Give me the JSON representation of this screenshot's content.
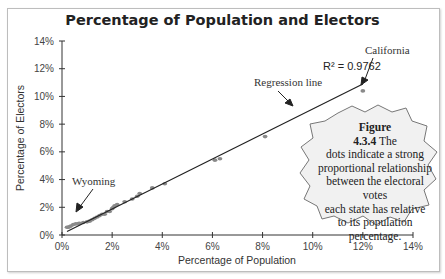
{
  "chart_data": {
    "type": "scatter",
    "title": "Percentage of  Population and Electors",
    "xlabel": "Percentage of Population",
    "ylabel": "Percentage of Electors",
    "xlim": [
      0,
      14
    ],
    "ylim": [
      0,
      14
    ],
    "x_ticks": [
      "0%",
      "2%",
      "4%",
      "6%",
      "8%",
      "10%",
      "12%",
      "14%"
    ],
    "y_ticks": [
      "0%",
      "2%",
      "4%",
      "6%",
      "8%",
      "10%",
      "12%",
      "14%"
    ],
    "grid": false,
    "legend": null,
    "points": [
      {
        "x": 0.2,
        "y": 0.56
      },
      {
        "x": 0.25,
        "y": 0.56
      },
      {
        "x": 0.3,
        "y": 0.6
      },
      {
        "x": 0.35,
        "y": 0.65
      },
      {
        "x": 0.45,
        "y": 0.75
      },
      {
        "x": 0.55,
        "y": 0.8
      },
      {
        "x": 0.65,
        "y": 0.82
      },
      {
        "x": 0.7,
        "y": 0.85
      },
      {
        "x": 0.85,
        "y": 0.9
      },
      {
        "x": 1.0,
        "y": 0.95
      },
      {
        "x": 1.1,
        "y": 1.0
      },
      {
        "x": 1.2,
        "y": 1.1
      },
      {
        "x": 1.3,
        "y": 1.2
      },
      {
        "x": 1.4,
        "y": 1.3
      },
      {
        "x": 1.5,
        "y": 1.4
      },
      {
        "x": 1.6,
        "y": 1.5
      },
      {
        "x": 1.7,
        "y": 1.5
      },
      {
        "x": 1.8,
        "y": 1.7
      },
      {
        "x": 1.9,
        "y": 1.7
      },
      {
        "x": 2.0,
        "y": 1.9
      },
      {
        "x": 2.05,
        "y": 2.0
      },
      {
        "x": 2.1,
        "y": 2.1
      },
      {
        "x": 2.2,
        "y": 2.2
      },
      {
        "x": 2.5,
        "y": 2.4
      },
      {
        "x": 2.8,
        "y": 2.6
      },
      {
        "x": 3.0,
        "y": 2.8
      },
      {
        "x": 3.1,
        "y": 3.0
      },
      {
        "x": 3.6,
        "y": 3.4
      },
      {
        "x": 4.1,
        "y": 3.7
      },
      {
        "x": 6.1,
        "y": 5.4
      },
      {
        "x": 6.3,
        "y": 5.5
      },
      {
        "x": 8.1,
        "y": 7.1
      },
      {
        "x": 12.0,
        "y": 10.4
      }
    ],
    "regression_line": {
      "x1": 0.2,
      "y1": 0.25,
      "x2": 12.0,
      "y2": 10.9,
      "r_squared": "R² = 0.9762"
    },
    "annotations": [
      {
        "text": "California",
        "x": 12.0,
        "y": 10.4
      },
      {
        "text": "Regression line",
        "x": 9.0,
        "y": 8.4
      },
      {
        "text": "Wyoming",
        "x": 0.2,
        "y": 0.56
      },
      {
        "text": "R² = 0.9762"
      }
    ]
  },
  "callout": {
    "heading": "Figure 4.3.4",
    "body": " The dots indicate a strong proportional relationship between the electoral votes each state has relative to its population percentage."
  },
  "labels": {
    "title": "Percentage of  Population and Electors",
    "xlabel": "Percentage of Population",
    "ylabel": "Percentage of Electors",
    "r2": "R² = 0.9762",
    "california": "California",
    "regression": "Regression line",
    "wyoming": "Wyoming",
    "callout_l1": "Figure",
    "callout_l2a": "4.3.4",
    "callout_l2b": " The",
    "callout_l3": "dots indicate a strong",
    "callout_l4": "proportional relationship",
    "callout_l5": "between the electoral votes",
    "callout_l6": "each state has relative",
    "callout_l7": "to its population",
    "callout_l8": "percentage."
  }
}
